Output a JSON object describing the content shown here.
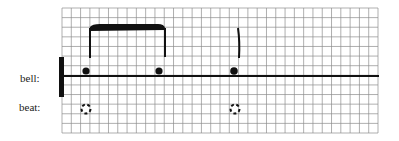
{
  "labels": {
    "bell": "bell:",
    "beat": "beat:"
  },
  "diagram": {
    "type": "rhythm notation on grid paper",
    "grid": {
      "cols": 34,
      "rows": 13,
      "color": "#8a8a8a"
    },
    "bell_notes": [
      {
        "x": 86,
        "stem": true,
        "beamed_group": 1
      },
      {
        "x": 159,
        "stem": true,
        "beamed_group": 1
      },
      {
        "x": 234,
        "stem": true,
        "beamed_group": null
      }
    ],
    "beat_markers": [
      {
        "x": 86,
        "style": "dashed-circle"
      },
      {
        "x": 235,
        "style": "dashed-circle"
      }
    ],
    "colors": {
      "ink": "#111111",
      "paper": "#ffffff"
    }
  }
}
